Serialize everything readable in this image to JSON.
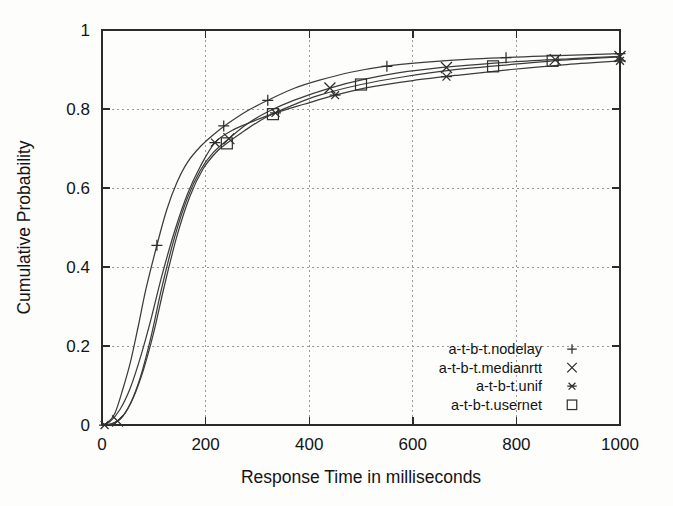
{
  "figure": {
    "background_color": "#fdfdfc",
    "ink_color": "#2b2b2b",
    "grid_color": "#9a9a9a"
  },
  "chart_data": {
    "type": "line",
    "title": "",
    "subtitle": "",
    "xlabel": "Response Time in milliseconds",
    "ylabel": "Cumulative Probability",
    "xlim": [
      0,
      1000
    ],
    "ylim": [
      0,
      1
    ],
    "xticks": [
      0,
      200,
      400,
      600,
      800,
      1000
    ],
    "xticklabels": [
      "0",
      "200",
      "400",
      "600",
      "800",
      "1000"
    ],
    "yticks": [
      0,
      0.2,
      0.4,
      0.6,
      0.8,
      1
    ],
    "yticklabels": [
      "0",
      "0.2",
      "0.4",
      "0.6",
      "0.8",
      "1"
    ],
    "grid": true,
    "grid_style": "dotted",
    "legend_position": "lower-right-inside",
    "series": [
      {
        "name": "a-t-b-t.nodelay",
        "marker": "plus",
        "points": [
          [
            0,
            0.0
          ],
          [
            10,
            0.005
          ],
          [
            25,
            0.03
          ],
          [
            40,
            0.09
          ],
          [
            55,
            0.16
          ],
          [
            70,
            0.25
          ],
          [
            85,
            0.345
          ],
          [
            106,
            0.455
          ],
          [
            125,
            0.545
          ],
          [
            145,
            0.615
          ],
          [
            165,
            0.665
          ],
          [
            190,
            0.705
          ],
          [
            215,
            0.735
          ],
          [
            245,
            0.765
          ],
          [
            280,
            0.795
          ],
          [
            320,
            0.822
          ],
          [
            370,
            0.852
          ],
          [
            420,
            0.873
          ],
          [
            480,
            0.893
          ],
          [
            545,
            0.908
          ],
          [
            620,
            0.918
          ],
          [
            720,
            0.927
          ],
          [
            850,
            0.934
          ],
          [
            1000,
            0.94
          ]
        ],
        "markers_at": [
          [
            106,
            0.455
          ],
          [
            235,
            0.757
          ],
          [
            320,
            0.822
          ],
          [
            550,
            0.908
          ],
          [
            780,
            0.93
          ],
          [
            1000,
            0.94
          ]
        ]
      },
      {
        "name": "a-t-b-t.medianrtt",
        "marker": "cross",
        "points": [
          [
            0,
            0.0
          ],
          [
            15,
            0.002
          ],
          [
            35,
            0.015
          ],
          [
            55,
            0.055
          ],
          [
            75,
            0.125
          ],
          [
            95,
            0.225
          ],
          [
            115,
            0.345
          ],
          [
            140,
            0.475
          ],
          [
            165,
            0.575
          ],
          [
            190,
            0.645
          ],
          [
            215,
            0.69
          ],
          [
            245,
            0.725
          ],
          [
            280,
            0.762
          ],
          [
            320,
            0.793
          ],
          [
            370,
            0.822
          ],
          [
            440,
            0.853
          ],
          [
            510,
            0.876
          ],
          [
            590,
            0.895
          ],
          [
            680,
            0.908
          ],
          [
            790,
            0.919
          ],
          [
            900,
            0.927
          ],
          [
            1000,
            0.933
          ]
        ],
        "markers_at": [
          [
            30,
            0.01
          ],
          [
            245,
            0.725
          ],
          [
            440,
            0.853
          ],
          [
            665,
            0.905
          ],
          [
            875,
            0.925
          ],
          [
            1000,
            0.933
          ]
        ]
      },
      {
        "name": "a-t-b-t.unif",
        "marker": "asterisk",
        "points": [
          [
            0,
            0.0
          ],
          [
            15,
            0.008
          ],
          [
            35,
            0.04
          ],
          [
            55,
            0.095
          ],
          [
            75,
            0.175
          ],
          [
            95,
            0.27
          ],
          [
            115,
            0.375
          ],
          [
            140,
            0.49
          ],
          [
            165,
            0.585
          ],
          [
            190,
            0.655
          ],
          [
            218,
            0.715
          ],
          [
            250,
            0.745
          ],
          [
            290,
            0.768
          ],
          [
            335,
            0.79
          ],
          [
            390,
            0.812
          ],
          [
            450,
            0.835
          ],
          [
            520,
            0.856
          ],
          [
            600,
            0.872
          ],
          [
            690,
            0.886
          ],
          [
            790,
            0.9
          ],
          [
            890,
            0.912
          ],
          [
            1000,
            0.922
          ]
        ],
        "markers_at": [
          [
            5,
            0.0
          ],
          [
            218,
            0.715
          ],
          [
            335,
            0.79
          ],
          [
            450,
            0.835
          ],
          [
            665,
            0.882
          ],
          [
            1000,
            0.922
          ]
        ]
      },
      {
        "name": "a-t-b-t.usernet",
        "marker": "square",
        "points": [
          [
            0,
            0.0
          ],
          [
            20,
            0.003
          ],
          [
            40,
            0.022
          ],
          [
            60,
            0.068
          ],
          [
            80,
            0.14
          ],
          [
            100,
            0.235
          ],
          [
            120,
            0.35
          ],
          [
            145,
            0.48
          ],
          [
            170,
            0.58
          ],
          [
            195,
            0.648
          ],
          [
            220,
            0.69
          ],
          [
            241,
            0.713
          ],
          [
            275,
            0.745
          ],
          [
            315,
            0.778
          ],
          [
            365,
            0.808
          ],
          [
            420,
            0.835
          ],
          [
            500,
            0.862
          ],
          [
            580,
            0.881
          ],
          [
            670,
            0.898
          ],
          [
            760,
            0.909
          ],
          [
            870,
            0.922
          ],
          [
            1000,
            0.932
          ]
        ],
        "markers_at": [
          [
            241,
            0.713
          ],
          [
            330,
            0.787
          ],
          [
            500,
            0.862
          ],
          [
            755,
            0.908
          ],
          [
            870,
            0.922
          ]
        ]
      }
    ]
  },
  "legend": {
    "entries": [
      {
        "label": "a-t-b-t.nodelay",
        "marker": "plus"
      },
      {
        "label": "a-t-b-t.medianrtt",
        "marker": "cross"
      },
      {
        "label": "a-t-b-t.unif",
        "marker": "asterisk"
      },
      {
        "label": "a-t-b-t.usernet",
        "marker": "square"
      }
    ]
  }
}
